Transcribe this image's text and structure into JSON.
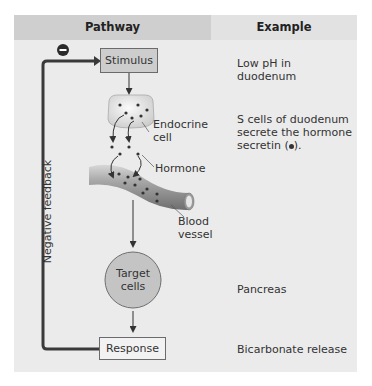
{
  "header": {
    "pathway_label": "Pathway",
    "example_label": "Example"
  },
  "pathway": {
    "stimulus": "Stimulus",
    "endocrine_cell_label_1": "Endocrine",
    "endocrine_cell_label_2": "cell",
    "hormone_label": "Hormone",
    "blood_vessel_label_1": "Blood",
    "blood_vessel_label_2": "vessel",
    "target_cells_label_1": "Target",
    "target_cells_label_2": "cells",
    "response": "Response",
    "feedback_label": "Negative feedback",
    "feedback_sign": "−"
  },
  "examples": {
    "stimulus_line1": "Low pH in",
    "stimulus_line2": "duodenum",
    "secretion_line1": "S cells of duodenum",
    "secretion_line2": "secrete the hormone",
    "secretion_line3": "secretin (",
    "secretion_line3_end": ").",
    "target": "Pancreas",
    "response": "Bicarbonate release"
  },
  "colors": {
    "panel_bg": "#ebebeb",
    "pathway_header_bg": "#cfcfcf",
    "example_header_bg": "#e2e2e2",
    "stimulus_box": "#cdcdcd",
    "target_cell": "#c4c4c4",
    "line": "#333333"
  }
}
